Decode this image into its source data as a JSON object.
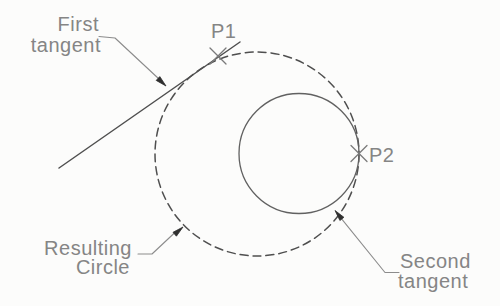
{
  "diagram": {
    "labels": {
      "first_tangent": {
        "line1": "First",
        "line2": "tangent"
      },
      "p1": "P1",
      "p2": "P2",
      "resulting_circle": {
        "line1": "Resulting",
        "line2": "Circle"
      },
      "second_tangent": {
        "line1": "Second",
        "line2": "tangent"
      }
    },
    "geometry": {
      "dashed_circle": {
        "cx": 257,
        "cy": 154,
        "r": 102
      },
      "solid_circle": {
        "cx": 299,
        "cy": 153.5,
        "r": 60
      },
      "tangent_line": {
        "x1": 59,
        "y1": 168,
        "x2": 240,
        "y2": 42
      },
      "p1_marker": {
        "x": 218,
        "y": 56
      },
      "p2_marker": {
        "x": 359,
        "y": 153.5
      }
    },
    "colors": {
      "background": "#fcfcfb",
      "geometry_stroke": "#4f4f4f",
      "solid_circle_stroke": "#616161",
      "leader_stroke": "#8c8c8c",
      "arrowhead_fill": "#2f2f2f",
      "text": "#858585",
      "marker": "#7a7a7a"
    }
  }
}
